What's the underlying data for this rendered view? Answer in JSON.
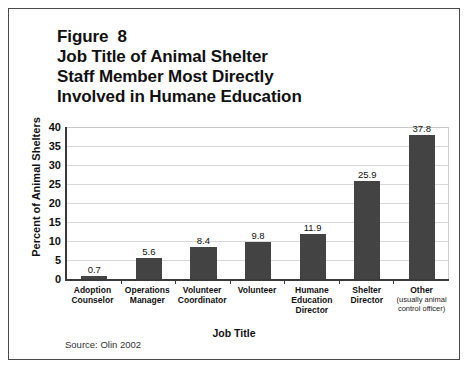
{
  "figure": {
    "title_lines": [
      "Figure  8",
      "Job Title of Animal Shelter",
      "Staff Member Most Directly",
      "Involved in Humane Education"
    ],
    "source_note": "Source: Olin 2002"
  },
  "colors": {
    "bar": "#434343",
    "axis": "#3a3a3a",
    "grid": "#d8d8d8",
    "frame": "#4a4a4a",
    "text": "#111111"
  },
  "chart_data": {
    "type": "bar",
    "title": "Figure 8 Job Title of Animal Shelter Staff Member Most Directly Involved in Humane Education",
    "xlabel": "Job Title",
    "ylabel": "Percent of Animal Shelters",
    "ylim": [
      0,
      40
    ],
    "yticks": [
      40,
      35,
      30,
      25,
      20,
      15,
      10,
      5,
      0
    ],
    "grid": true,
    "legend": "none",
    "categories": [
      "Adoption Counselor",
      "Operations Manager",
      "Volunteer Coordinator",
      "Volunteer",
      "Humane Education Director",
      "Shelter Director",
      "Other"
    ],
    "category_lines": [
      [
        "Adoption",
        "Counselor"
      ],
      [
        "Operations",
        "Manager"
      ],
      [
        "Volunteer",
        "Coordinator"
      ],
      [
        "Volunteer"
      ],
      [
        "Humane",
        "Education",
        "Director"
      ],
      [
        "Shelter",
        "Director"
      ],
      [
        "Other"
      ]
    ],
    "category_sublabels": [
      null,
      null,
      null,
      null,
      null,
      null,
      "(usually animal control officer)"
    ],
    "values": [
      0.7,
      5.6,
      8.4,
      9.8,
      11.9,
      25.9,
      37.8
    ],
    "value_labels": [
      "0.7",
      "5.6",
      "8.4",
      "9.8",
      "11.9",
      "25.9",
      "37.8"
    ],
    "source": "Source: Olin 2002"
  }
}
